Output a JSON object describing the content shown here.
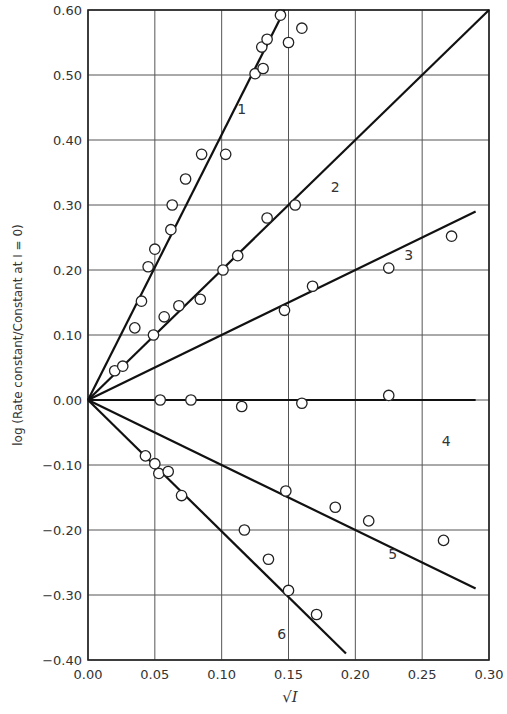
{
  "chart_data": {
    "type": "scatter",
    "title": "",
    "xlabel": "√I",
    "ylabel": "log (Rate constant/Constant at I = 0)",
    "xlim": [
      0.0,
      0.3
    ],
    "ylim": [
      -0.4,
      0.6
    ],
    "grid": true,
    "legend": "none (lines labelled 1–6 inline)",
    "x_ticks": [
      "0.00",
      "0.05",
      "0.10",
      "0.15",
      "0.20",
      "0.25",
      "0.30"
    ],
    "y_ticks": [
      "0.60",
      "0.50",
      "0.40",
      "0.30",
      "0.20",
      "0.10",
      "0.00",
      "-0.10",
      "-0.20",
      "-0.30",
      "-0.40"
    ],
    "series": [
      {
        "name": "1",
        "label_pos": [
          0.115,
          0.44
        ],
        "fit_line": [
          [
            0.0,
            0.0
          ],
          [
            0.147,
            0.6
          ]
        ],
        "points": [
          [
            0.045,
            0.205
          ],
          [
            0.05,
            0.232
          ],
          [
            0.062,
            0.262
          ],
          [
            0.063,
            0.3
          ],
          [
            0.073,
            0.34
          ],
          [
            0.085,
            0.378
          ],
          [
            0.103,
            0.378
          ],
          [
            0.04,
            0.152
          ],
          [
            0.035,
            0.111
          ],
          [
            0.125,
            0.502
          ],
          [
            0.131,
            0.51
          ],
          [
            0.13,
            0.543
          ],
          [
            0.134,
            0.555
          ],
          [
            0.144,
            0.592
          ],
          [
            0.15,
            0.55
          ],
          [
            0.16,
            0.572
          ]
        ]
      },
      {
        "name": "2",
        "label_pos": [
          0.185,
          0.32
        ],
        "fit_line": [
          [
            0.0,
            0.0
          ],
          [
            0.3,
            0.6
          ]
        ],
        "points": [
          [
            0.02,
            0.045
          ],
          [
            0.026,
            0.052
          ],
          [
            0.049,
            0.1
          ],
          [
            0.057,
            0.128
          ],
          [
            0.068,
            0.145
          ],
          [
            0.084,
            0.155
          ],
          [
            0.101,
            0.2
          ],
          [
            0.112,
            0.222
          ],
          [
            0.134,
            0.28
          ],
          [
            0.155,
            0.3
          ]
        ]
      },
      {
        "name": "3",
        "label_pos": [
          0.24,
          0.215
        ],
        "fit_line": [
          [
            0.0,
            0.0
          ],
          [
            0.29,
            0.29
          ]
        ],
        "points": [
          [
            0.147,
            0.138
          ],
          [
            0.168,
            0.175
          ],
          [
            0.225,
            0.203
          ],
          [
            0.272,
            0.252
          ]
        ]
      },
      {
        "name": "4",
        "label_pos": [
          0.268,
          -0.07
        ],
        "fit_line": [
          [
            0.0,
            0.0
          ],
          [
            0.29,
            0.0
          ]
        ],
        "points": [
          [
            0.054,
            0.0
          ],
          [
            0.077,
            0.0
          ],
          [
            0.115,
            -0.01
          ],
          [
            0.16,
            -0.005
          ],
          [
            0.225,
            0.007
          ]
        ]
      },
      {
        "name": "5",
        "label_pos": [
          0.228,
          -0.245
        ],
        "fit_line": [
          [
            0.0,
            0.0
          ],
          [
            0.29,
            -0.29
          ]
        ],
        "points": [
          [
            0.148,
            -0.14
          ],
          [
            0.185,
            -0.165
          ],
          [
            0.21,
            -0.186
          ],
          [
            0.266,
            -0.216
          ]
        ]
      },
      {
        "name": "6",
        "label_pos": [
          0.145,
          -0.368
        ],
        "fit_line": [
          [
            0.0,
            0.0
          ],
          [
            0.193,
            -0.39
          ]
        ],
        "points": [
          [
            0.043,
            -0.086
          ],
          [
            0.05,
            -0.098
          ],
          [
            0.053,
            -0.113
          ],
          [
            0.06,
            -0.11
          ],
          [
            0.07,
            -0.147
          ],
          [
            0.117,
            -0.2
          ],
          [
            0.135,
            -0.245
          ],
          [
            0.15,
            -0.293
          ],
          [
            0.171,
            -0.33
          ]
        ]
      }
    ]
  }
}
